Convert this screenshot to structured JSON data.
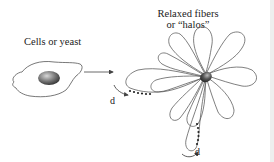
{
  "diagram": {
    "left_label": "Cells or yeast",
    "right_label_line1": "Relaxed fibers",
    "right_label_line2": "or “halos”",
    "distance_label_1": "d",
    "distance_label_2": "d",
    "colors": {
      "stroke": "#555555",
      "nucleus_dark": "#3a3a3a",
      "nucleus_light": "#c8c8c8",
      "background": "#ffffff",
      "edge_stripe": "#eeeeee"
    }
  }
}
